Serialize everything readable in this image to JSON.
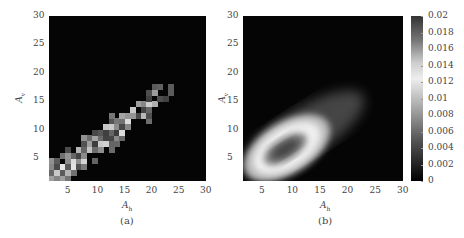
{
  "chart_data": [
    {
      "panel": "(a)",
      "type": "heatmap",
      "title": "",
      "xlabel": "A_h",
      "ylabel": "A_v",
      "xlim": [
        1,
        30
      ],
      "ylim": [
        1,
        30
      ],
      "x_ticks": [
        "5",
        "10",
        "15",
        "20",
        "25",
        "30"
      ],
      "y_ticks": [
        "5",
        "10",
        "15",
        "20",
        "25",
        "30"
      ],
      "colormap": "grayscale",
      "description": "Empirical 2D histogram, pixelated; bright cells concentrated along diagonal band from (2,2) to (23,17), densest for A_h 2-14, A_v 2-12"
    },
    {
      "panel": "(b)",
      "type": "heatmap",
      "title": "",
      "xlabel": "A_h",
      "ylabel": "A_v",
      "xlim": [
        1,
        30
      ],
      "ylim": [
        1,
        30
      ],
      "x_ticks": [
        "5",
        "10",
        "15",
        "20",
        "25",
        "30"
      ],
      "y_ticks": [
        "5",
        "10",
        "15",
        "20",
        "25",
        "30"
      ],
      "colormap": "custom grayscale (dark-bright-dark)",
      "colorbar": {
        "range": [
          0,
          0.02
        ],
        "ticks": [
          "0",
          "0.002",
          "0.004",
          "0.006",
          "0.008",
          "0.01",
          "0.012",
          "0.014",
          "0.016",
          "0.018",
          "0.02"
        ]
      },
      "description": "Smooth fitted 2D density; elliptical ridge centered near (7,5) tilted along diagonal, peak region darker (high values), tail extending to (18,14)"
    }
  ],
  "panel_a": {
    "caption": "(a)",
    "xlabel": "A",
    "xlabel_sub": "h",
    "ylabel": "A",
    "ylabel_sub": "v",
    "x_ticks": [
      "5",
      "10",
      "15",
      "20",
      "25",
      "30"
    ],
    "y_ticks": [
      "5",
      "10",
      "15",
      "20",
      "25",
      "30"
    ]
  },
  "panel_b": {
    "caption": "(b)",
    "xlabel": "A",
    "xlabel_sub": "h",
    "ylabel": "A",
    "ylabel_sub": "v",
    "x_ticks": [
      "5",
      "10",
      "15",
      "20",
      "25",
      "30"
    ],
    "y_ticks": [
      "5",
      "10",
      "15",
      "20",
      "25",
      "30"
    ],
    "colorbar_ticks": [
      "0.02",
      "0.018",
      "0.016",
      "0.014",
      "0.012",
      "0.01",
      "0.008",
      "0.006",
      "0.004",
      "0.002",
      "0"
    ]
  }
}
